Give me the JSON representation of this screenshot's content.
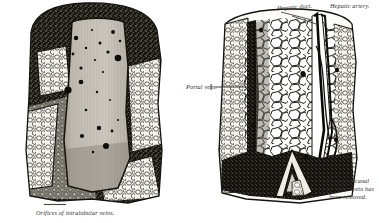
{
  "plate": {
    "title": "Liver structure engraving",
    "figures": [
      {
        "id": "left",
        "name": "Interior of hepatic vein",
        "caption": "Orifices of intralobular veins."
      },
      {
        "id": "right",
        "name": "Portal canal and lobules",
        "labels": {
          "hepatic_duct": "Hepatic duct.",
          "hepatic_artery": "Hepatic artery.",
          "portal_vein": "Portal vein.",
          "canal_note": "Portion of canal from which vein has been removed."
        }
      }
    ]
  },
  "colors": {
    "background": "#ffffff",
    "ink": "#2b2b28",
    "dark_tissue": "#1d1b19",
    "mid_tissue": "#8a867e",
    "light_cell": "#f2f0ea",
    "vein_lining": "#b9b5ac"
  }
}
